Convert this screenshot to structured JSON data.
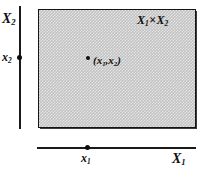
{
  "figure": {
    "region_label": {
      "first_set": "X",
      "first_sub": "1",
      "operator": "×",
      "second_set": "X",
      "second_sub": "2"
    },
    "axes": {
      "vertical": {
        "name": "X",
        "subscript": "2",
        "tick_name": "x",
        "tick_subscript": "2"
      },
      "horizontal": {
        "name": "X",
        "subscript": "1",
        "tick_name": "x",
        "tick_subscript": "1"
      }
    },
    "point": {
      "open_paren": "(",
      "first": "x",
      "first_sub": "1",
      "comma": ",",
      "second": "x",
      "second_sub": "2",
      "close_paren": ")"
    },
    "colors": {
      "ink": "#111111",
      "region_fill": "#c2c2c2",
      "region_border": "#141414"
    }
  }
}
